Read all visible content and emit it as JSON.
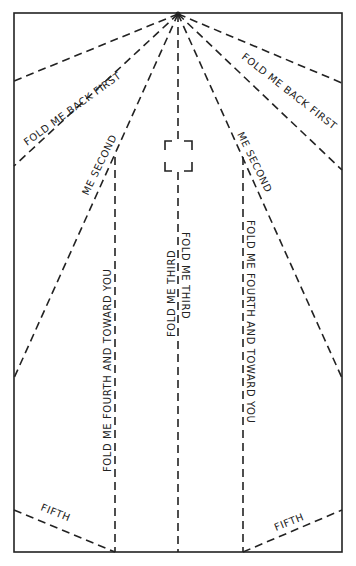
{
  "diagram": {
    "labels": {
      "back_first_left": "FOLD ME BACK FIRST",
      "back_first_right": "FOLD ME BACK FIRST",
      "second_left": "ME SECOND",
      "second_right": "ME SECOND",
      "third_left": "FOLD ME THIRD",
      "third_right": "FOLD ME THIRD",
      "fourth_left": "FOLD ME FOURTH AND TOWARD YOU",
      "fourth_right": "FOLD ME FOURTH AND TOWARD YOU",
      "fifth_left": "FIFTH",
      "fifth_right": "FIFTH"
    },
    "colors": {
      "line": "#222222",
      "paper": "#ffffff"
    }
  }
}
